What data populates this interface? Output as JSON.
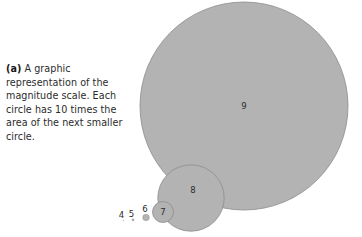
{
  "figure": {
    "panel_label": "(a)",
    "caption_text": " A graphic representation of the magnitude scale. Each circle has 10 times the area of the next smaller circle.",
    "caption_lines": [
      "A graphic repre-",
      "sentation of the",
      "magnitude scale.",
      "Each circle has",
      "10 times the area",
      "of the next smaller",
      "circle."
    ]
  },
  "colors": {
    "background": "#ffffff",
    "circle_fill": "#b3b3b3",
    "circle_stroke": "#8c8c8c",
    "text": "#2b2b2b",
    "label_bold": "#171717"
  },
  "chart_data": {
    "type": "scatter",
    "title": "A graphic representation of the magnitude scale.",
    "subtitle": "Each circle has 10 times the area of the next smaller circle.",
    "xlabel": "",
    "ylabel": "",
    "grid": false,
    "legend": "none",
    "area_ratio_between_steps": 10,
    "radius_ratio_between_steps": 3.162,
    "categories": [
      "4",
      "5",
      "6",
      "7",
      "8",
      "9"
    ],
    "series": [
      {
        "name": "magnitude circles",
        "values": [
          0.35,
          1.1,
          3.3,
          10.5,
          33.2,
          104.0
        ]
      }
    ],
    "circles": [
      {
        "label": "4",
        "cx": 123.5,
        "cy": 220.6,
        "r": 0.35,
        "label_x": 121.5,
        "label_y": 215.5,
        "label_inside": false
      },
      {
        "label": "5",
        "cx": 133.0,
        "cy": 219.8,
        "r": 1.1,
        "label_x": 131.5,
        "label_y": 214.0,
        "label_inside": false
      },
      {
        "label": "6",
        "cx": 146.0,
        "cy": 217.5,
        "r": 3.3,
        "label_x": 145.0,
        "label_y": 209.5,
        "label_inside": false
      },
      {
        "label": "7",
        "cx": 163.0,
        "cy": 212.0,
        "r": 10.5,
        "label_x": 163.0,
        "label_y": 212.0,
        "label_inside": true
      },
      {
        "label": "8",
        "cx": 191.0,
        "cy": 198.0,
        "r": 33.2,
        "label_x": 193.0,
        "label_y": 190.0,
        "label_inside": true
      },
      {
        "label": "9",
        "cx": 244.0,
        "cy": 106.0,
        "r": 104.0,
        "label_x": 244.0,
        "label_y": 106.0,
        "label_inside": true
      }
    ]
  }
}
